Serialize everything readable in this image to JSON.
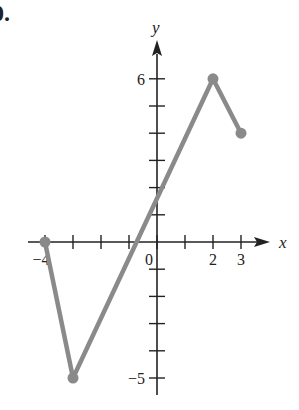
{
  "problem": {
    "label": "0."
  },
  "chart_data": {
    "type": "line",
    "title": "",
    "xlabel": "x",
    "ylabel": "y",
    "x": [
      -4,
      -3,
      2,
      3
    ],
    "series": [
      {
        "name": "f(x)",
        "values": [
          0,
          -5,
          6,
          4
        ],
        "color": "#8a8a8a"
      }
    ],
    "endpoints": [
      [
        -4,
        0
      ],
      [
        -3,
        -5
      ],
      [
        2,
        6
      ],
      [
        3,
        4
      ]
    ],
    "xlim": [
      -4,
      3
    ],
    "ylim": [
      -5,
      6
    ],
    "x_tick_labels": {
      "-4": "−4",
      "0": "0",
      "2": "2",
      "3": "3"
    },
    "y_tick_labels": {
      "6": "6",
      "-5": "−5"
    },
    "x_ticks": [
      -4,
      -3,
      -2,
      -1,
      0,
      1,
      2,
      3
    ],
    "y_ticks": [
      -5,
      -4,
      -3,
      -2,
      -1,
      1,
      2,
      3,
      4,
      5,
      6
    ],
    "grid": false,
    "legend": "none"
  }
}
